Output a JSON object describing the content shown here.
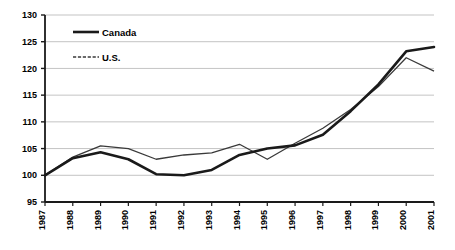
{
  "chart_data": {
    "type": "line",
    "title": "",
    "subtitle": "",
    "xlabel": "",
    "ylabel": "",
    "categories": [
      "1987",
      "1988",
      "1989",
      "1990",
      "1991",
      "1992",
      "1993",
      "1994",
      "1995",
      "1996",
      "1997",
      "1998",
      "1999",
      "2000",
      "2001"
    ],
    "x": [
      1987,
      1988,
      1989,
      1990,
      1991,
      1992,
      1993,
      1994,
      1995,
      1996,
      1997,
      1998,
      1999,
      2000,
      2001
    ],
    "series": [
      {
        "name": "Canada",
        "style": "solid-thick",
        "color": "#1a1a1a",
        "values": [
          100.0,
          103.2,
          104.3,
          103.0,
          100.2,
          100.0,
          101.0,
          103.8,
          105.0,
          105.6,
          107.6,
          112.0,
          117.0,
          123.2,
          124.0
        ]
      },
      {
        "name": "U.S.",
        "style": "dashed-thin",
        "color": "#3a3a3a",
        "values": [
          100.0,
          103.4,
          105.5,
          105.0,
          103.0,
          103.8,
          104.2,
          105.8,
          103.0,
          106.0,
          108.8,
          112.3,
          116.6,
          122.0,
          119.5
        ]
      }
    ],
    "ylim": [
      95,
      130
    ],
    "yticks": [
      95,
      100,
      105,
      110,
      115,
      120,
      125,
      130
    ],
    "grid": true,
    "legend_position": "top-left",
    "legend_entries": [
      "Canada",
      "U.S."
    ]
  },
  "legend": {
    "canada_label": "Canada",
    "us_label": "U.S."
  },
  "axes": {
    "y_labels": [
      "130",
      "125",
      "120",
      "115",
      "110",
      "105",
      "100",
      "95"
    ],
    "x_labels": [
      "1987",
      "1988",
      "1989",
      "1990",
      "1991",
      "1992",
      "1993",
      "1994",
      "1995",
      "1996",
      "1997",
      "1998",
      "1999",
      "2000",
      "2001"
    ]
  }
}
